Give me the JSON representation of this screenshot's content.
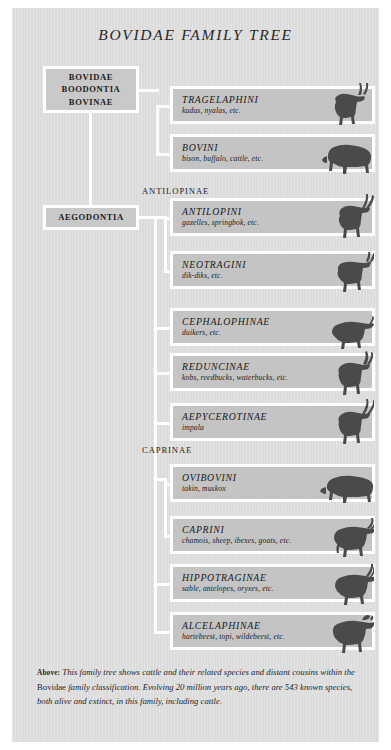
{
  "title": "BOVIDAE FAMILY TREE",
  "ancestors": [
    {
      "id": "root",
      "label": "BOVIDAE\nBOODONTIA\nBOVINAE"
    },
    {
      "id": "aegodontia",
      "label": "AEGODONTIA"
    }
  ],
  "group_labels": [
    {
      "id": "antilopinae",
      "label": "ANTILOPINAE"
    },
    {
      "id": "caprinae",
      "label": "CAPRINAE"
    }
  ],
  "taxa": [
    {
      "name": "TRAGELAPHINI",
      "examples": "kudus, nyalas, etc.",
      "animal": "kudu-silhouette"
    },
    {
      "name": "BOVINI",
      "examples": "bison, buffalo, cattle, etc.",
      "animal": "bison-silhouette"
    },
    {
      "name": "ANTILOPINI",
      "examples": "gazelles, springbok, etc.",
      "animal": "gazelle-silhouette"
    },
    {
      "name": "NEOTRAGINI",
      "examples": "dik-diks, etc.",
      "animal": "dikdik-silhouette"
    },
    {
      "name": "CEPHALOPHINAE",
      "examples": "duikers, etc.",
      "animal": "duiker-silhouette"
    },
    {
      "name": "REDUNCINAE",
      "examples": "kobs, reedbucks, waterbucks, etc.",
      "animal": "reedbuck-silhouette"
    },
    {
      "name": "AEPYCEROTINAE",
      "examples": "impala",
      "animal": "impala-silhouette"
    },
    {
      "name": "OVIBOVINI",
      "examples": "takin, muskox",
      "animal": "muskox-silhouette"
    },
    {
      "name": "CAPRINI",
      "examples": "chamois, sheep, ibexes, goats, etc.",
      "animal": "goat-silhouette"
    },
    {
      "name": "HIPPOTRAGINAE",
      "examples": "sable, antelopes, oryxes, etc.",
      "animal": "oryx-silhouette"
    },
    {
      "name": "ALCELAPHINAE",
      "examples": "hartebeest, topi, wildebeest, etc.",
      "animal": "wildebeest-silhouette"
    }
  ],
  "caption": {
    "lead": "Above:",
    "part1": " This family tree shows cattle and their related species and distant cousins within the ",
    "roman": "Bovidae",
    "part2": " family classification. Evolving 20 million years ago, there are 543 known species, both alive and extinct, in this family, including cattle."
  },
  "colors": {
    "panel_background": "#dcdcdc",
    "bar_fill": "#c4c4c4",
    "ancestor_fill": "#c9c9c9",
    "connector": "#ffffff",
    "text": "#1b1b1b",
    "silhouette": "#4a4a4a",
    "page": "#ffffff"
  }
}
